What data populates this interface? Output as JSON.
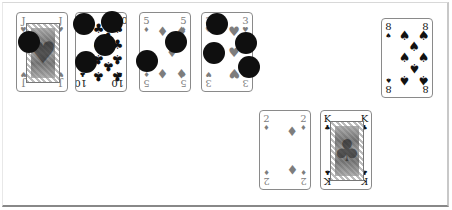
{
  "board": {
    "colors": {
      "table_bg": "#ffffff",
      "card_border": "#8a8a8a",
      "token": "#0f0f0f",
      "red_suit": "#7d7d7d",
      "black_suit": "#111111"
    }
  },
  "cards": [
    {
      "id": "jack-hearts",
      "rank": "J",
      "suit": "♥",
      "suit_name": "hearts",
      "face": true,
      "x": 16,
      "y": 12
    },
    {
      "id": "ten-clubs",
      "rank": "10",
      "suit": "♣",
      "suit_name": "clubs",
      "face": false,
      "x": 75,
      "y": 12
    },
    {
      "id": "five-diamonds",
      "rank": "5",
      "suit": "♦",
      "suit_name": "diamonds",
      "face": false,
      "x": 139,
      "y": 12
    },
    {
      "id": "three-hearts",
      "rank": "3",
      "suit": "♥",
      "suit_name": "hearts",
      "face": false,
      "x": 201,
      "y": 12
    },
    {
      "id": "eight-spades",
      "rank": "8",
      "suit": "♠",
      "suit_name": "spades",
      "face": false,
      "x": 381,
      "y": 18
    },
    {
      "id": "two-diamonds",
      "rank": "2",
      "suit": "♦",
      "suit_name": "diamonds",
      "face": false,
      "x": 259,
      "y": 110
    },
    {
      "id": "king-clubs",
      "rank": "K",
      "suit": "♣",
      "suit_name": "clubs",
      "face": true,
      "x": 320,
      "y": 110
    }
  ],
  "tokens": [
    {
      "x": 18,
      "y": 31
    },
    {
      "x": 73,
      "y": 13
    },
    {
      "x": 101,
      "y": 11
    },
    {
      "x": 94,
      "y": 34
    },
    {
      "x": 75,
      "y": 51
    },
    {
      "x": 136,
      "y": 50
    },
    {
      "x": 165,
      "y": 31
    },
    {
      "x": 206,
      "y": 13
    },
    {
      "x": 203,
      "y": 42
    },
    {
      "x": 235,
      "y": 32
    },
    {
      "x": 238,
      "y": 56
    }
  ]
}
